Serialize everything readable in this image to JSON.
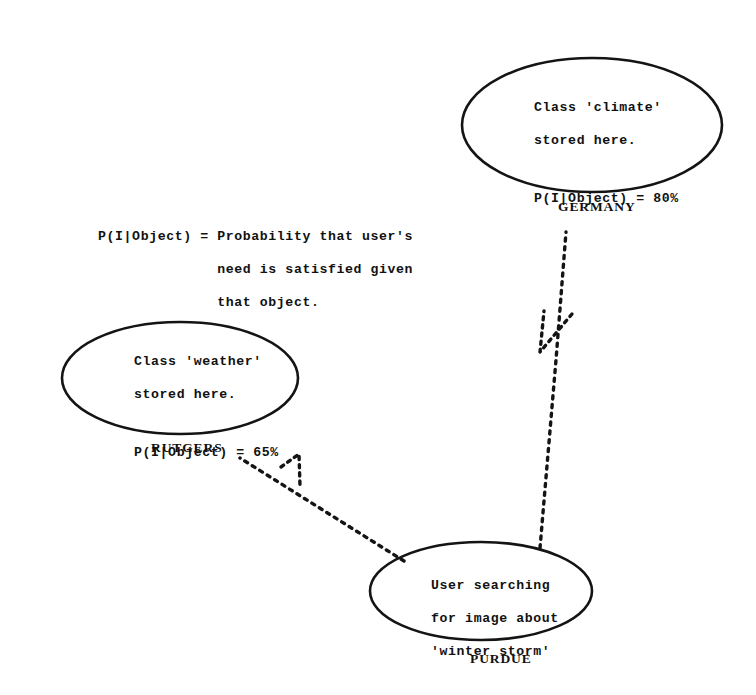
{
  "diagram": {
    "background_color": "#ffffff",
    "ink_color": "#141414"
  },
  "legend": {
    "line1": "P(I|Object) = Probability that user's",
    "line2": "              need is satisfied given",
    "line3": "              that object."
  },
  "nodes": {
    "germany": {
      "site_label": "GERMANY",
      "line1": "Class 'climate'",
      "line2": "stored here.",
      "line3": "P(I|Object) = 80%",
      "probability_value": "80%",
      "stored_class": "climate"
    },
    "rutgers": {
      "site_label": "RUTGERS",
      "line1": "Class 'weather'",
      "line2": "stored here.",
      "line3": "P(I|Object) = 65%",
      "probability_value": "65%",
      "stored_class": "weather"
    },
    "purdue": {
      "site_label": "PURDUE",
      "line1": "User searching",
      "line2": "for image about",
      "line3": "'winter storm'",
      "query_term": "winter storm"
    }
  },
  "connectors": {
    "purdue_to_germany": "dashed-query-arrow",
    "purdue_to_rutgers": "dashed-query-arrow"
  }
}
